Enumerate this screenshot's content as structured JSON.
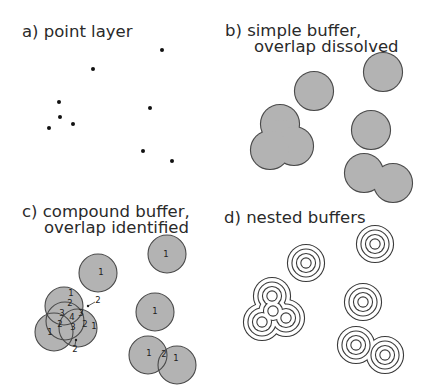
{
  "panels": {
    "a": {
      "title": "a) point layer"
    },
    "b": {
      "title_line1": "b) simple buffer,",
      "title_line2": "overlap dissolved"
    },
    "c": {
      "title_line1": "c) compound buffer,",
      "title_line2": "overlap identified"
    },
    "d": {
      "title": "d) nested buffers"
    }
  },
  "points": [
    [
      162,
      50
    ],
    [
      93,
      69
    ],
    [
      59,
      102
    ],
    [
      60,
      117
    ],
    [
      73,
      124
    ],
    [
      49,
      128
    ],
    [
      150,
      108
    ],
    [
      143,
      151
    ],
    [
      172,
      161
    ]
  ],
  "colors": {
    "fill": "#b3b3b3",
    "stroke": "#4a4a4a",
    "point": "#111111"
  },
  "compound_labels": [
    {
      "t": "1",
      "x": 71,
      "y": 296
    },
    {
      "t": "2",
      "x": 70,
      "y": 306
    },
    {
      "t": "3",
      "x": 62,
      "y": 316
    },
    {
      "t": "4",
      "x": 72,
      "y": 320
    },
    {
      "t": "3",
      "x": 81,
      "y": 316
    },
    {
      "t": "2",
      "x": 60,
      "y": 327
    },
    {
      "t": "3",
      "x": 73,
      "y": 330
    },
    {
      "t": "2",
      "x": 85,
      "y": 327
    },
    {
      "t": "1",
      "x": 50,
      "y": 335
    },
    {
      "t": "1",
      "x": 94,
      "y": 329
    },
    {
      "t": "2",
      "x": 98,
      "y": 303
    },
    {
      "t": "2",
      "x": 75,
      "y": 352
    },
    {
      "t": "1",
      "x": 101,
      "y": 275
    },
    {
      "t": "1",
      "x": 166,
      "y": 257
    },
    {
      "t": "1",
      "x": 155,
      "y": 314
    },
    {
      "t": "1",
      "x": 149,
      "y": 356
    },
    {
      "t": "2",
      "x": 164,
      "y": 357
    },
    {
      "t": "1",
      "x": 176,
      "y": 361
    }
  ]
}
